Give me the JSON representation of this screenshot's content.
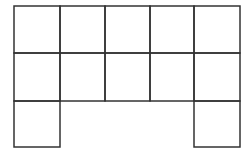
{
  "figure": {
    "line_color": "#333333",
    "background": "#ffffff",
    "columns_x": [
      14,
      60,
      105,
      150,
      194,
      240
    ],
    "rows_y": [
      6,
      53,
      101,
      147
    ],
    "cells": [
      {
        "row": 0,
        "col": 0
      },
      {
        "row": 0,
        "col": 1
      },
      {
        "row": 0,
        "col": 2
      },
      {
        "row": 0,
        "col": 3
      },
      {
        "row": 0,
        "col": 4
      },
      {
        "row": 1,
        "col": 0
      },
      {
        "row": 1,
        "col": 1
      },
      {
        "row": 1,
        "col": 2
      },
      {
        "row": 1,
        "col": 3
      },
      {
        "row": 1,
        "col": 4
      },
      {
        "row": 2,
        "col": 0
      },
      {
        "row": 2,
        "col": 4
      }
    ]
  }
}
